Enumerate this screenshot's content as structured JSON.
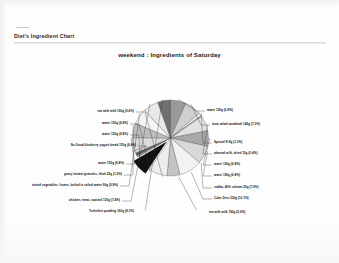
{
  "document": {
    "header_title": "Diet's Ingredient Chart"
  },
  "chart_data": {
    "type": "pie",
    "title": "weekend : Ingredients of Saturday",
    "xlabel": "",
    "ylabel": "",
    "legend_position": "labels-with-leader-lines",
    "grid": false,
    "value_unit": "g",
    "slices": [
      {
        "label": "water 150g (6.8%)",
        "value": 6.8,
        "amount": "150g",
        "color": "#9a9a9a",
        "exploded": false
      },
      {
        "label": "tuna salad sandwich 145g (7.3%)",
        "value": 7.3,
        "amount": "145g",
        "color": "#cfcfcf",
        "exploded": false
      },
      {
        "label": "Special K 8g (1.3%)",
        "value": 1.3,
        "amount": "8g",
        "color": "#efefef",
        "exploded": false
      },
      {
        "label": "almond milk, dried 12g (0.4%)",
        "value": 0.4,
        "amount": "12g",
        "color": "#b5b5b5",
        "exploded": false
      },
      {
        "label": "water 150g (6.8%)",
        "value": 6.8,
        "amount": "150g",
        "color": "#e2e2e2",
        "exploded": false
      },
      {
        "label": "water 150g (6.8%)",
        "value": 6.8,
        "amount": "150g",
        "color": "#a8a8a8",
        "exploded": false
      },
      {
        "label": "vodka, 40% volume 25g (7.9%)",
        "value": 7.9,
        "amount": "25g",
        "color": "#d8d8d8",
        "exploded": false
      },
      {
        "label": "Coke Zero 330g (10.1%)",
        "value": 10.1,
        "amount": "330g",
        "color": "#f2f2f2",
        "exploded": false
      },
      {
        "label": "tea with milk 190g (5.6%)",
        "value": 5.6,
        "amount": "190g",
        "color": "#c4c4c4",
        "exploded": false
      },
      {
        "label": "Yorkshire pudding 160g (8.1%)",
        "value": 8.1,
        "amount": "160g",
        "color": "#ededed",
        "exploded": false
      },
      {
        "label": "chicken, meat, roasted 130g (7.4%)",
        "value": 7.4,
        "amount": "130g",
        "color": "#111111",
        "exploded": true
      },
      {
        "label": "mixed vegetables, frozen, boiled in salted water 90g (0.9%)",
        "value": 0.9,
        "amount": "90g",
        "color": "#9e9e9e",
        "exploded": false
      },
      {
        "label": "gravy instant granules, thick 25g (1.2%)",
        "value": 1.2,
        "amount": "25g",
        "color": "#5d5d5d",
        "exploded": false
      },
      {
        "label": "water 150g (6.8%)",
        "value": 6.8,
        "amount": "150g",
        "color": "#dcdcdc",
        "exploded": false
      },
      {
        "label": "So Good blueberry yogurt break 150g (6.4%)",
        "value": 6.4,
        "amount": "150g",
        "color": "#bdbdbd",
        "exploded": false
      },
      {
        "label": "water 150g (6.8%)",
        "value": 6.8,
        "amount": "150g",
        "color": "#f4f4f4",
        "exploded": false
      },
      {
        "label": "water 150g (6.8%)",
        "value": 6.8,
        "amount": "150g",
        "color": "#e8e8e8",
        "exploded": false
      },
      {
        "label": "tea with milk 190g (5.6%)",
        "value": 5.6,
        "amount": "190g",
        "color": "#6f6f6f",
        "exploded": false
      }
    ],
    "labels_left": [
      {
        "text": "tea with milk  190g (5.6%)",
        "x": 134,
        "y": 50
      },
      {
        "text": "water 150g (6.8%)",
        "x": 128,
        "y": 62
      },
      {
        "text": "water 150g (6.8%)",
        "x": 128,
        "y": 73
      },
      {
        "text": "So Good blueberry yogurt break 150g (6.4%)",
        "x": 136,
        "y": 84
      },
      {
        "text": "water 150g (6.8%)",
        "x": 124,
        "y": 102
      },
      {
        "text": "gravy instant granules, thick 25g (1.2%)",
        "x": 122,
        "y": 113
      },
      {
        "text": "mixed vegetables, frozen, boiled in salted water 90g (0.9%)",
        "x": 118,
        "y": 124
      },
      {
        "text": "chicken, meat, roasted 130g (7.4%)",
        "x": 120,
        "y": 139
      },
      {
        "text": "Yorkshire pudding 160g (8.1%)",
        "x": 134,
        "y": 150
      }
    ],
    "labels_right": [
      {
        "text": "water 150g (6.8%)",
        "x": 207,
        "y": 49
      },
      {
        "text": "tuna salad sandwich 145g (7.3%)",
        "x": 212,
        "y": 63
      },
      {
        "text": "Special K 8g (1.3%)",
        "x": 214,
        "y": 81
      },
      {
        "text": "almond milk, dried 12g (0.4%)",
        "x": 214,
        "y": 92
      },
      {
        "text": "water 150g (6.8%)",
        "x": 214,
        "y": 103
      },
      {
        "text": "water 150g (6.8%)",
        "x": 214,
        "y": 114
      },
      {
        "text": "vodka,  40% volume 25g (7.9%)",
        "x": 214,
        "y": 126
      },
      {
        "text": "Coke Zero 330g (10.1%)",
        "x": 214,
        "y": 137
      },
      {
        "text": "tea with milk  190g (5.6%)",
        "x": 209,
        "y": 151
      }
    ]
  }
}
